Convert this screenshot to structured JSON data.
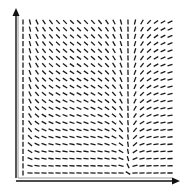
{
  "chart_data": {
    "type": "vector-field",
    "title": "",
    "xlabel": "",
    "ylabel": "",
    "xlim": [
      0,
      1
    ],
    "ylim": [
      0,
      1
    ],
    "grid": {
      "cols": 22,
      "rows": 22
    },
    "field": {
      "description": "direction field: marks vertical over most of the plane, tilting to near-horizontal toward the right edge and bottom edge; slopes negative left of x≈0.72 near the bottom, positive to the right",
      "dx": "8*x*(x-0.72)",
      "dy": "y+0.02",
      "singular_x": 0.72
    },
    "axes": {
      "x_arrow": true,
      "y_arrow": true,
      "box_left": true,
      "box_bottom": true
    },
    "colors": {
      "mark": "#1a1a1a",
      "axis": "#111111"
    }
  }
}
